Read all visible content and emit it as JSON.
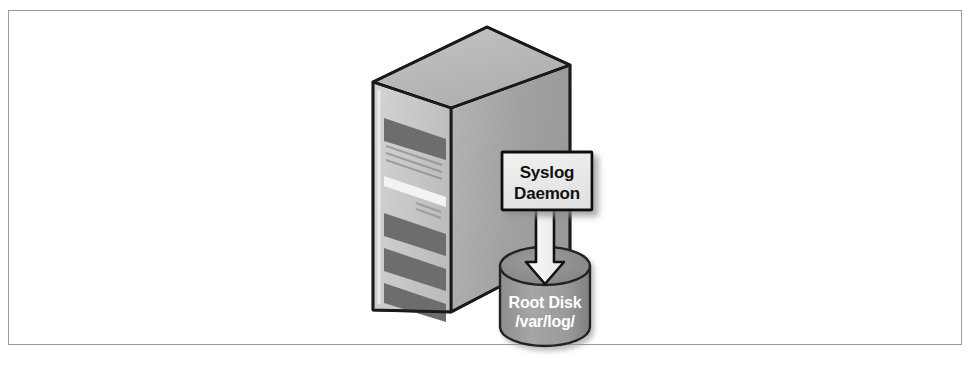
{
  "figure": {
    "kind": "isometric-infrastructure-diagram",
    "background_color": "#ffffff",
    "frame": {
      "border_color": "#9a9a9e",
      "fill_color": "#ffffff"
    }
  },
  "server": {
    "name": "server-tower",
    "description": "Isometric 3D server tower with drive bays",
    "colors": {
      "top_face": "#b8b8b8",
      "front_face": "#c9c9c9",
      "side_face": "#a3a3a3",
      "outline": "#1a1a1a",
      "bay_dark": "#6e6e6e",
      "bay_highlight": "#ececec"
    },
    "bay_count": 4,
    "vent_rows": 2
  },
  "daemon_box": {
    "name": "syslog-daemon-callout",
    "line1": "Syslog",
    "line2": "Daemon",
    "fill_color": "#ededed",
    "border_color": "#111111",
    "text_color": "#111111",
    "shadow_color": "#b0b0b0"
  },
  "arrow": {
    "name": "write-arrow",
    "direction": "down",
    "fill_color": "#f2f2f2",
    "outline_color": "#111111"
  },
  "disk": {
    "name": "root-disk-cylinder",
    "line1": "Root Disk",
    "line2": "/var/log/",
    "body_color": "#9b9b9b",
    "top_color": "#8a8a8a",
    "outline_color": "#222222",
    "text_color": "#ffffff"
  }
}
